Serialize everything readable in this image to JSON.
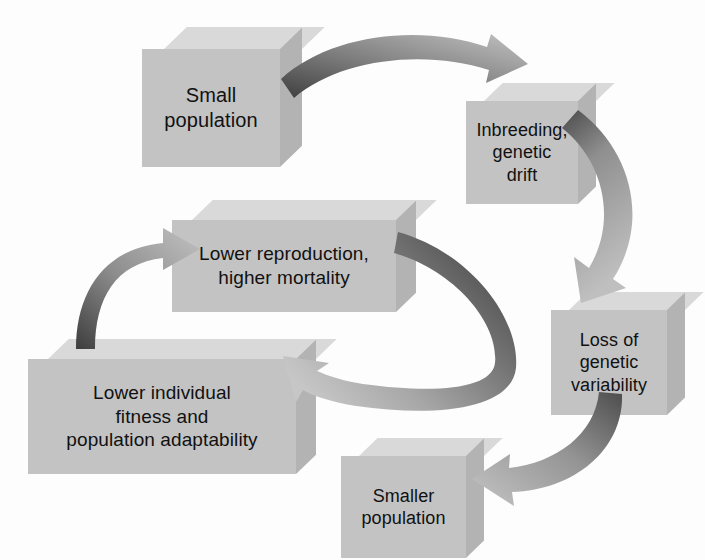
{
  "diagram": {
    "type": "cycle-flowchart",
    "background_color": "#fdfdfd",
    "box_face_color": "#c3c3c3",
    "box_top_color": "#d9d9d9",
    "box_side_color": "#b3b3b3",
    "arrow_dark_color": "#4d4d4d",
    "arrow_light_color": "#bdbdbd",
    "text_color": "#111111",
    "nodes": [
      {
        "id": "small-population",
        "label": "Small\npopulation",
        "x": 142,
        "y": 27,
        "w": 138,
        "h": 118,
        "depth": 22,
        "font_size": 20
      },
      {
        "id": "inbreeding-genetic-drift",
        "label": "Inbreeding,\ngenetic\ndrift",
        "x": 466,
        "y": 83,
        "w": 112,
        "h": 103,
        "depth": 18,
        "font_size": 18
      },
      {
        "id": "loss-of-genetic-variability",
        "label": "Loss of\ngenetic\nvariability",
        "x": 551,
        "y": 292,
        "w": 116,
        "h": 105,
        "depth": 18,
        "font_size": 18
      },
      {
        "id": "smaller-population",
        "label": "Smaller\npopulation",
        "x": 341,
        "y": 438,
        "w": 125,
        "h": 102,
        "depth": 18,
        "font_size": 18
      },
      {
        "id": "lower-individual-fitness",
        "label": "Lower individual\nfitness and\npopulation adaptability",
        "x": 28,
        "y": 339,
        "w": 268,
        "h": 115,
        "depth": 20,
        "font_size": 19
      },
      {
        "id": "lower-reproduction-higher-mortality",
        "label": "Lower reproduction,\nhigher mortality",
        "x": 172,
        "y": 200,
        "w": 224,
        "h": 92,
        "depth": 20,
        "font_size": 19
      }
    ],
    "edges": [
      {
        "id": "edge-small-population-to-inbreeding",
        "from": "small-population",
        "to": "inbreeding-genetic-drift",
        "direction": "right-then-down"
      },
      {
        "id": "edge-inbreeding-to-loss-of-variability",
        "from": "inbreeding-genetic-drift",
        "to": "loss-of-genetic-variability",
        "direction": "down-right-loop"
      },
      {
        "id": "edge-loss-of-variability-to-smaller-population",
        "from": "loss-of-genetic-variability",
        "to": "smaller-population",
        "direction": "down-left-loop"
      },
      {
        "id": "edge-lower-reproduction-to-lower-fitness",
        "from": "lower-reproduction-higher-mortality",
        "to": "lower-individual-fitness",
        "direction": "right-down-sweep-left"
      },
      {
        "id": "edge-lower-fitness-to-lower-reproduction",
        "from": "lower-individual-fitness",
        "to": "lower-reproduction-higher-mortality",
        "direction": "up-right"
      }
    ]
  }
}
